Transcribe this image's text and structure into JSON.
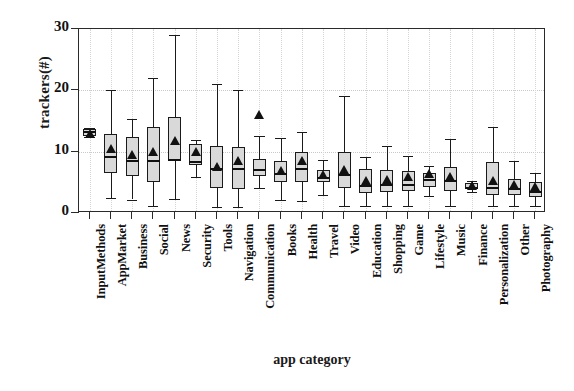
{
  "chart_data": {
    "type": "box",
    "title": "",
    "xlabel": "app category",
    "ylabel": "trackers(#)",
    "ylim": [
      0,
      30
    ],
    "yticks": [
      0,
      10,
      20,
      30
    ],
    "grid": true,
    "legend": "none",
    "marker_note": "black triangle = mean",
    "categories": [
      "InputMethods",
      "AppMarket",
      "Business",
      "Social",
      "News",
      "Security",
      "Tools",
      "Navigation",
      "Communication",
      "Books",
      "Health",
      "Travel",
      "Video",
      "Education",
      "Shopping",
      "Game",
      "Lifestyle",
      "Music",
      "Finance",
      "Personalization",
      "Other",
      "Photography"
    ],
    "boxes": [
      {
        "category": "InputMethods",
        "min": 12.4,
        "q1": 12.6,
        "median": 13.4,
        "q3": 13.7,
        "max": 13.9,
        "mean": 12.8
      },
      {
        "category": "AppMarket",
        "min": 2.4,
        "q1": 6.6,
        "median": 9.3,
        "q3": 12.9,
        "max": 20.1,
        "mean": 10.4
      },
      {
        "category": "Business",
        "min": 2.2,
        "q1": 6.0,
        "median": 8.6,
        "q3": 12.4,
        "max": 15.3,
        "mean": 9.4
      },
      {
        "category": "Social",
        "min": 1.2,
        "q1": 5.0,
        "median": 8.6,
        "q3": 14.0,
        "max": 22.0,
        "mean": 9.9
      },
      {
        "category": "News",
        "min": 2.3,
        "q1": 8.7,
        "median": 8.8,
        "q3": 15.6,
        "max": 29.0,
        "mean": 11.7
      },
      {
        "category": "Security",
        "min": 5.8,
        "q1": 7.9,
        "median": 8.5,
        "q3": 11.2,
        "max": 11.9,
        "mean": 9.9
      },
      {
        "category": "Tools",
        "min": 1.0,
        "q1": 4.0,
        "median": 7.4,
        "q3": 11.0,
        "max": 21.0,
        "mean": 7.5
      },
      {
        "category": "Navigation",
        "min": 1.0,
        "q1": 3.9,
        "median": 7.3,
        "q3": 10.8,
        "max": 20.0,
        "mean": 8.5
      },
      {
        "category": "Communication",
        "min": 4.0,
        "q1": 6.0,
        "median": 7.1,
        "q3": 8.8,
        "max": 12.6,
        "mean": 16.0
      },
      {
        "category": "Books",
        "min": 2.2,
        "q1": 5.0,
        "median": 6.6,
        "q3": 8.5,
        "max": 12.3,
        "mean": 6.8
      },
      {
        "category": "Health",
        "min": 1.9,
        "q1": 5.0,
        "median": 7.4,
        "q3": 10.0,
        "max": 13.2,
        "mean": 8.5
      },
      {
        "category": "Travel",
        "min": 3.0,
        "q1": 5.0,
        "median": 5.8,
        "q3": 7.0,
        "max": 8.6,
        "mean": 6.2
      },
      {
        "category": "Video",
        "min": 1.2,
        "q1": 4.0,
        "median": 6.3,
        "q3": 10.0,
        "max": 19.0,
        "mean": 7.0
      },
      {
        "category": "Education",
        "min": 1.2,
        "q1": 3.3,
        "median": 4.6,
        "q3": 7.1,
        "max": 9.2,
        "mean": 5.2
      },
      {
        "category": "Shopping",
        "min": 1.2,
        "q1": 3.5,
        "median": 4.8,
        "q3": 7.0,
        "max": 11.0,
        "mean": 5.4
      },
      {
        "category": "Game",
        "min": 1.2,
        "q1": 3.6,
        "median": 4.8,
        "q3": 6.9,
        "max": 9.3,
        "mean": 5.9
      },
      {
        "category": "Lifestyle",
        "min": 2.8,
        "q1": 4.2,
        "median": 5.5,
        "q3": 6.5,
        "max": 7.6,
        "mean": 6.3
      },
      {
        "category": "Music",
        "min": 1.2,
        "q1": 3.6,
        "median": 5.3,
        "q3": 7.5,
        "max": 12.0,
        "mean": 5.9
      },
      {
        "category": "Finance",
        "min": 3.5,
        "q1": 4.0,
        "median": 4.3,
        "q3": 4.9,
        "max": 5.2,
        "mean": 4.4
      },
      {
        "category": "Personalization",
        "min": 1.2,
        "q1": 3.0,
        "median": 4.3,
        "q3": 8.3,
        "max": 14.0,
        "mean": 5.2
      },
      {
        "category": "Other",
        "min": 1.2,
        "q1": 2.9,
        "median": 4.0,
        "q3": 5.6,
        "max": 8.4,
        "mean": 4.5
      },
      {
        "category": "Photography",
        "min": 1.2,
        "q1": 2.6,
        "median": 3.6,
        "q3": 5.0,
        "max": 6.5,
        "mean": 4.2
      }
    ]
  },
  "colors": {
    "box_fill": "#d9d9d9",
    "line": "#1a1a1a",
    "grid": "#c9c9c9",
    "text": "#111111"
  }
}
